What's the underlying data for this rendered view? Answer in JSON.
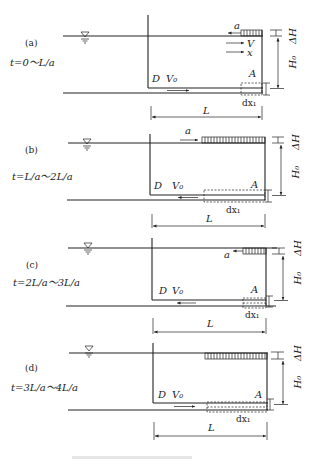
{
  "figure": {
    "panels": [
      {
        "id": "a",
        "label": "(a)",
        "time": "t=0～L/a",
        "wave_label": "a",
        "wave_direction": "left",
        "velocity_label": "V",
        "x_label": "x",
        "reservoir_label": "D",
        "v0_label": "V₀",
        "valve_label": "A",
        "dx_label": "dx₁",
        "length_label": "L",
        "dh_label": "ΔH",
        "h0_label": "H₀",
        "flow_arrow": "right"
      },
      {
        "id": "b",
        "label": "(b)",
        "time": "t=L/a～2L/a",
        "wave_label": "a",
        "wave_direction": "right",
        "reservoir_label": "D",
        "v0_label": "V₀",
        "valve_label": "A",
        "dx_label": "dx₁",
        "length_label": "L",
        "dh_label": "ΔH",
        "h0_label": "H₀",
        "flow_arrow": "left"
      },
      {
        "id": "c",
        "label": "(c)",
        "time": "t=2L/a～3L/a",
        "wave_label": "a",
        "wave_direction": "left",
        "reservoir_label": "D",
        "v0_label": "V₀",
        "valve_label": "A",
        "dx_label": "dx₁",
        "length_label": "L",
        "dh_label": "ΔH",
        "h0_label": "H₀",
        "flow_arrow": "left"
      },
      {
        "id": "d",
        "label": "(d)",
        "time": "t=3L/a～4L/a",
        "reservoir_label": "D",
        "v0_label": "V₀",
        "valve_label": "A",
        "dx_label": "dx₁",
        "length_label": "L",
        "dh_label": "ΔH",
        "h0_label": "H₀",
        "flow_arrow": "right"
      }
    ]
  }
}
